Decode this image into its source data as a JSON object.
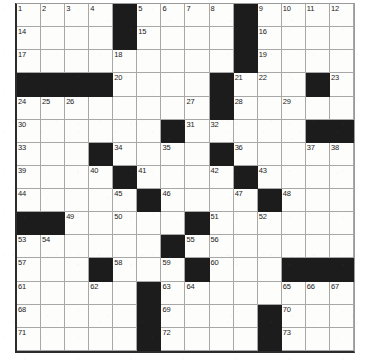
{
  "puzzle": {
    "type": "crossword-grid",
    "title": "Crossword Puzzle Grid",
    "columns": 14,
    "rows": 14,
    "block_color": "#1c1c1c",
    "cell_color": "#fdfdfb",
    "grid_line_color": "#a8a8a8",
    "number_color": "#1a1a1a",
    "highest_clue_number": 73,
    "block_count": 48,
    "legend": {
      "block": "black square (no entry)",
      "open": "white square (letter entry)"
    },
    "grid": [
      [
        {
          "type": "open",
          "num": "1"
        },
        {
          "type": "open",
          "num": "2"
        },
        {
          "type": "open",
          "num": "3"
        },
        {
          "type": "open",
          "num": "4"
        },
        {
          "type": "block",
          "num": ""
        },
        {
          "type": "open",
          "num": "5"
        },
        {
          "type": "open",
          "num": "6"
        },
        {
          "type": "open",
          "num": "7"
        },
        {
          "type": "open",
          "num": "8"
        },
        {
          "type": "block",
          "num": ""
        },
        {
          "type": "open",
          "num": "9"
        },
        {
          "type": "open",
          "num": "10"
        },
        {
          "type": "open",
          "num": "11"
        },
        {
          "type": "open",
          "num": "12"
        }
      ],
      [
        {
          "type": "open",
          "num": "14"
        },
        {
          "type": "open",
          "num": ""
        },
        {
          "type": "open",
          "num": ""
        },
        {
          "type": "open",
          "num": ""
        },
        {
          "type": "block",
          "num": ""
        },
        {
          "type": "open",
          "num": "15"
        },
        {
          "type": "open",
          "num": ""
        },
        {
          "type": "open",
          "num": ""
        },
        {
          "type": "open",
          "num": ""
        },
        {
          "type": "block",
          "num": ""
        },
        {
          "type": "open",
          "num": "16"
        },
        {
          "type": "open",
          "num": ""
        },
        {
          "type": "open",
          "num": ""
        },
        {
          "type": "open",
          "num": ""
        }
      ],
      [
        {
          "type": "open",
          "num": "17"
        },
        {
          "type": "open",
          "num": ""
        },
        {
          "type": "open",
          "num": ""
        },
        {
          "type": "open",
          "num": ""
        },
        {
          "type": "open",
          "num": "18"
        },
        {
          "type": "open",
          "num": ""
        },
        {
          "type": "open",
          "num": ""
        },
        {
          "type": "open",
          "num": ""
        },
        {
          "type": "open",
          "num": ""
        },
        {
          "type": "block",
          "num": ""
        },
        {
          "type": "open",
          "num": "19"
        },
        {
          "type": "open",
          "num": ""
        },
        {
          "type": "open",
          "num": ""
        },
        {
          "type": "open",
          "num": ""
        }
      ],
      [
        {
          "type": "block",
          "num": ""
        },
        {
          "type": "block",
          "num": ""
        },
        {
          "type": "block",
          "num": ""
        },
        {
          "type": "block",
          "num": ""
        },
        {
          "type": "open",
          "num": "20"
        },
        {
          "type": "open",
          "num": ""
        },
        {
          "type": "open",
          "num": ""
        },
        {
          "type": "open",
          "num": ""
        },
        {
          "type": "block",
          "num": ""
        },
        {
          "type": "open",
          "num": "21"
        },
        {
          "type": "open",
          "num": "22"
        },
        {
          "type": "open",
          "num": ""
        },
        {
          "type": "block",
          "num": ""
        },
        {
          "type": "open",
          "num": "23"
        }
      ],
      [
        {
          "type": "open",
          "num": "24"
        },
        {
          "type": "open",
          "num": "25"
        },
        {
          "type": "open",
          "num": "26"
        },
        {
          "type": "open",
          "num": ""
        },
        {
          "type": "open",
          "num": ""
        },
        {
          "type": "open",
          "num": ""
        },
        {
          "type": "open",
          "num": ""
        },
        {
          "type": "open",
          "num": "27"
        },
        {
          "type": "block",
          "num": ""
        },
        {
          "type": "open",
          "num": "28"
        },
        {
          "type": "open",
          "num": ""
        },
        {
          "type": "open",
          "num": "29"
        },
        {
          "type": "open",
          "num": ""
        },
        {
          "type": "open",
          "num": ""
        }
      ],
      [
        {
          "type": "open",
          "num": "30"
        },
        {
          "type": "open",
          "num": ""
        },
        {
          "type": "open",
          "num": ""
        },
        {
          "type": "open",
          "num": ""
        },
        {
          "type": "open",
          "num": ""
        },
        {
          "type": "open",
          "num": ""
        },
        {
          "type": "block",
          "num": ""
        },
        {
          "type": "open",
          "num": "31"
        },
        {
          "type": "open",
          "num": "32"
        },
        {
          "type": "open",
          "num": ""
        },
        {
          "type": "open",
          "num": ""
        },
        {
          "type": "open",
          "num": ""
        },
        {
          "type": "block",
          "num": ""
        },
        {
          "type": "block",
          "num": ""
        }
      ],
      [
        {
          "type": "open",
          "num": "33"
        },
        {
          "type": "open",
          "num": ""
        },
        {
          "type": "open",
          "num": ""
        },
        {
          "type": "block",
          "num": ""
        },
        {
          "type": "open",
          "num": "34"
        },
        {
          "type": "open",
          "num": ""
        },
        {
          "type": "open",
          "num": "35"
        },
        {
          "type": "open",
          "num": ""
        },
        {
          "type": "block",
          "num": ""
        },
        {
          "type": "open",
          "num": "36"
        },
        {
          "type": "open",
          "num": ""
        },
        {
          "type": "open",
          "num": ""
        },
        {
          "type": "open",
          "num": "37"
        },
        {
          "type": "open",
          "num": "38"
        }
      ],
      [
        {
          "type": "open",
          "num": "39"
        },
        {
          "type": "open",
          "num": ""
        },
        {
          "type": "open",
          "num": ""
        },
        {
          "type": "open",
          "num": "40"
        },
        {
          "type": "block",
          "num": ""
        },
        {
          "type": "open",
          "num": "41"
        },
        {
          "type": "open",
          "num": ""
        },
        {
          "type": "open",
          "num": ""
        },
        {
          "type": "open",
          "num": "42"
        },
        {
          "type": "block",
          "num": ""
        },
        {
          "type": "open",
          "num": "43"
        },
        {
          "type": "open",
          "num": ""
        },
        {
          "type": "open",
          "num": ""
        },
        {
          "type": "open",
          "num": ""
        }
      ],
      [
        {
          "type": "open",
          "num": "44"
        },
        {
          "type": "open",
          "num": ""
        },
        {
          "type": "open",
          "num": ""
        },
        {
          "type": "open",
          "num": ""
        },
        {
          "type": "open",
          "num": "45"
        },
        {
          "type": "block",
          "num": ""
        },
        {
          "type": "open",
          "num": "46"
        },
        {
          "type": "open",
          "num": ""
        },
        {
          "type": "open",
          "num": ""
        },
        {
          "type": "open",
          "num": "47"
        },
        {
          "type": "block",
          "num": ""
        },
        {
          "type": "open",
          "num": "48"
        },
        {
          "type": "open",
          "num": ""
        },
        {
          "type": "open",
          "num": ""
        }
      ],
      [
        {
          "type": "block",
          "num": ""
        },
        {
          "type": "block",
          "num": ""
        },
        {
          "type": "open",
          "num": "49"
        },
        {
          "type": "open",
          "num": ""
        },
        {
          "type": "open",
          "num": "50"
        },
        {
          "type": "open",
          "num": ""
        },
        {
          "type": "open",
          "num": ""
        },
        {
          "type": "block",
          "num": ""
        },
        {
          "type": "open",
          "num": "51"
        },
        {
          "type": "open",
          "num": ""
        },
        {
          "type": "open",
          "num": "52"
        },
        {
          "type": "open",
          "num": ""
        },
        {
          "type": "open",
          "num": ""
        },
        {
          "type": "open",
          "num": ""
        }
      ],
      [
        {
          "type": "open",
          "num": "53"
        },
        {
          "type": "open",
          "num": "54"
        },
        {
          "type": "open",
          "num": ""
        },
        {
          "type": "open",
          "num": ""
        },
        {
          "type": "open",
          "num": ""
        },
        {
          "type": "open",
          "num": ""
        },
        {
          "type": "block",
          "num": ""
        },
        {
          "type": "open",
          "num": "55"
        },
        {
          "type": "open",
          "num": "56"
        },
        {
          "type": "open",
          "num": ""
        },
        {
          "type": "open",
          "num": ""
        },
        {
          "type": "open",
          "num": ""
        },
        {
          "type": "open",
          "num": ""
        },
        {
          "type": "open",
          "num": ""
        }
      ],
      [
        {
          "type": "open",
          "num": "57"
        },
        {
          "type": "open",
          "num": ""
        },
        {
          "type": "open",
          "num": ""
        },
        {
          "type": "block",
          "num": ""
        },
        {
          "type": "open",
          "num": "58"
        },
        {
          "type": "open",
          "num": ""
        },
        {
          "type": "open",
          "num": "59"
        },
        {
          "type": "block",
          "num": ""
        },
        {
          "type": "open",
          "num": "60"
        },
        {
          "type": "open",
          "num": ""
        },
        {
          "type": "open",
          "num": ""
        },
        {
          "type": "block",
          "num": ""
        },
        {
          "type": "block",
          "num": ""
        },
        {
          "type": "block",
          "num": ""
        }
      ],
      [
        {
          "type": "open",
          "num": "61"
        },
        {
          "type": "open",
          "num": ""
        },
        {
          "type": "open",
          "num": ""
        },
        {
          "type": "open",
          "num": "62"
        },
        {
          "type": "open",
          "num": ""
        },
        {
          "type": "block",
          "num": ""
        },
        {
          "type": "open",
          "num": "63"
        },
        {
          "type": "open",
          "num": "64"
        },
        {
          "type": "open",
          "num": ""
        },
        {
          "type": "open",
          "num": ""
        },
        {
          "type": "open",
          "num": ""
        },
        {
          "type": "open",
          "num": "65"
        },
        {
          "type": "open",
          "num": "66"
        },
        {
          "type": "open",
          "num": "67"
        }
      ],
      [
        {
          "type": "open",
          "num": "68"
        },
        {
          "type": "open",
          "num": ""
        },
        {
          "type": "open",
          "num": ""
        },
        {
          "type": "open",
          "num": ""
        },
        {
          "type": "open",
          "num": ""
        },
        {
          "type": "block",
          "num": ""
        },
        {
          "type": "open",
          "num": "69"
        },
        {
          "type": "open",
          "num": ""
        },
        {
          "type": "open",
          "num": ""
        },
        {
          "type": "open",
          "num": ""
        },
        {
          "type": "block",
          "num": ""
        },
        {
          "type": "open",
          "num": "70"
        },
        {
          "type": "open",
          "num": ""
        },
        {
          "type": "open",
          "num": ""
        }
      ],
      [
        {
          "type": "open",
          "num": "71"
        },
        {
          "type": "open",
          "num": ""
        },
        {
          "type": "open",
          "num": ""
        },
        {
          "type": "open",
          "num": ""
        },
        {
          "type": "open",
          "num": ""
        },
        {
          "type": "block",
          "num": ""
        },
        {
          "type": "open",
          "num": "72"
        },
        {
          "type": "open",
          "num": ""
        },
        {
          "type": "open",
          "num": ""
        },
        {
          "type": "open",
          "num": ""
        },
        {
          "type": "block",
          "num": ""
        },
        {
          "type": "open",
          "num": "73"
        },
        {
          "type": "open",
          "num": ""
        },
        {
          "type": "open",
          "num": ""
        }
      ]
    ]
  }
}
